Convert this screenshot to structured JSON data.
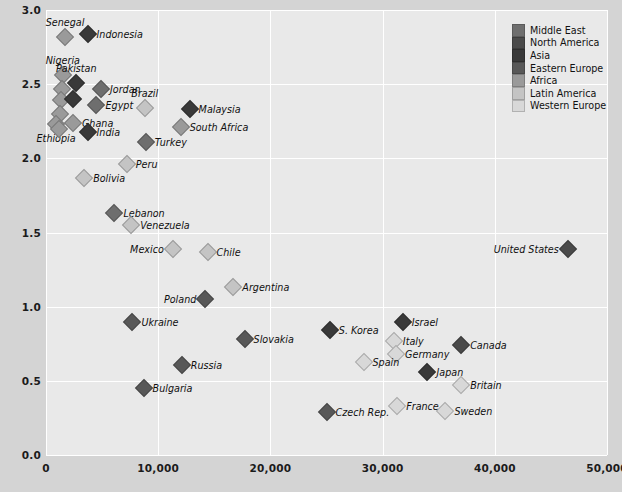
{
  "chart_data": {
    "type": "scatter",
    "title": "",
    "xlabel": "",
    "ylabel": "Score on religiosity scale",
    "xlim": [
      0,
      50000
    ],
    "ylim": [
      0,
      3.0
    ],
    "grid": true,
    "legend_position": "top-right",
    "xticks": [
      "0",
      "10,000",
      "20,000",
      "30,000",
      "40,000",
      "50,000"
    ],
    "xtick_values": [
      0,
      10000,
      20000,
      30000,
      40000,
      50000
    ],
    "yticks": [
      "0.0",
      "0.5",
      "1.0",
      "1.5",
      "2.0",
      "2.5",
      "3.0"
    ],
    "ytick_values": [
      0.0,
      0.5,
      1.0,
      1.5,
      2.0,
      2.5,
      3.0
    ],
    "legend": [
      {
        "name": "Middle East",
        "color": "#6e6e6e"
      },
      {
        "name": "North America",
        "color": "#4a4a4a"
      },
      {
        "name": "Asia",
        "color": "#393939"
      },
      {
        "name": "Eastern Europe",
        "color": "#585858"
      },
      {
        "name": "Africa",
        "color": "#9a9a9a"
      },
      {
        "name": "Latin America",
        "color": "#c4c4c4"
      },
      {
        "name": "Western Europe",
        "color": "#d8d8d8"
      }
    ],
    "points": [
      {
        "name": "Senegal",
        "x": 1700,
        "y": 2.82,
        "group": "Africa",
        "label_pos": "t"
      },
      {
        "name": "Indonesia",
        "x": 3700,
        "y": 2.84,
        "group": "Asia",
        "label_pos": "r"
      },
      {
        "name": "Nigeria",
        "x": 1500,
        "y": 2.56,
        "group": "Africa",
        "label_pos": "t"
      },
      {
        "name": "Pakistan",
        "x": 2700,
        "y": 2.51,
        "group": "Asia",
        "label_pos": "t"
      },
      {
        "name": "Jordan",
        "x": 4900,
        "y": 2.47,
        "group": "Middle East",
        "label_pos": "r"
      },
      {
        "name": "Uganda",
        "x": 1450,
        "y": 2.47,
        "group": "Africa",
        "label_pos": "none"
      },
      {
        "name": "Mali",
        "x": 1350,
        "y": 2.39,
        "group": "Africa",
        "label_pos": "none"
      },
      {
        "name": "Bangladesh",
        "x": 2400,
        "y": 2.4,
        "group": "Asia",
        "label_pos": "none"
      },
      {
        "name": "Egypt",
        "x": 4500,
        "y": 2.36,
        "group": "Middle East",
        "label_pos": "r"
      },
      {
        "name": "Brazil",
        "x": 8800,
        "y": 2.34,
        "group": "Latin America",
        "label_pos": "t"
      },
      {
        "name": "Malaysia",
        "x": 12800,
        "y": 2.33,
        "group": "Asia",
        "label_pos": "r"
      },
      {
        "name": "Tanzania",
        "x": 1250,
        "y": 2.3,
        "group": "Africa",
        "label_pos": "none"
      },
      {
        "name": "Ghana",
        "x": 2400,
        "y": 2.24,
        "group": "Africa",
        "label_pos": "r"
      },
      {
        "name": "South Africa",
        "x": 12000,
        "y": 2.21,
        "group": "Africa",
        "label_pos": "r"
      },
      {
        "name": "Ethiopia",
        "x": 900,
        "y": 2.23,
        "group": "Africa",
        "label_pos": "b"
      },
      {
        "name": "Kenya",
        "x": 1150,
        "y": 2.2,
        "group": "Africa",
        "label_pos": "none"
      },
      {
        "name": "India",
        "x": 3700,
        "y": 2.18,
        "group": "Asia",
        "label_pos": "r"
      },
      {
        "name": "Turkey",
        "x": 8900,
        "y": 2.11,
        "group": "Middle East",
        "label_pos": "r"
      },
      {
        "name": "Peru",
        "x": 7200,
        "y": 1.96,
        "group": "Latin America",
        "label_pos": "r"
      },
      {
        "name": "Bolivia",
        "x": 3400,
        "y": 1.87,
        "group": "Latin America",
        "label_pos": "r"
      },
      {
        "name": "Lebanon",
        "x": 6100,
        "y": 1.63,
        "group": "Middle East",
        "label_pos": "r"
      },
      {
        "name": "Venezuela",
        "x": 7600,
        "y": 1.55,
        "group": "Latin America",
        "label_pos": "r"
      },
      {
        "name": "Mexico",
        "x": 11300,
        "y": 1.39,
        "group": "Latin America",
        "label_pos": "l"
      },
      {
        "name": "Chile",
        "x": 14400,
        "y": 1.37,
        "group": "Latin America",
        "label_pos": "r"
      },
      {
        "name": "United States",
        "x": 46500,
        "y": 1.39,
        "group": "North America",
        "label_pos": "l"
      },
      {
        "name": "Argentina",
        "x": 16700,
        "y": 1.13,
        "group": "Latin America",
        "label_pos": "r"
      },
      {
        "name": "Poland",
        "x": 14200,
        "y": 1.05,
        "group": "Eastern Europe",
        "label_pos": "l"
      },
      {
        "name": "Israel",
        "x": 31800,
        "y": 0.9,
        "group": "Asia",
        "label_pos": "r"
      },
      {
        "name": "Ukraine",
        "x": 7700,
        "y": 0.9,
        "group": "Eastern Europe",
        "label_pos": "r"
      },
      {
        "name": "S. Korea",
        "x": 25300,
        "y": 0.84,
        "group": "Asia",
        "label_pos": "r"
      },
      {
        "name": "Slovakia",
        "x": 17700,
        "y": 0.78,
        "group": "Eastern Europe",
        "label_pos": "r"
      },
      {
        "name": "Italy",
        "x": 31000,
        "y": 0.77,
        "group": "Western Europe",
        "label_pos": "r"
      },
      {
        "name": "Canada",
        "x": 37000,
        "y": 0.74,
        "group": "North America",
        "label_pos": "r"
      },
      {
        "name": "Germany",
        "x": 31200,
        "y": 0.68,
        "group": "Western Europe",
        "label_pos": "r"
      },
      {
        "name": "Spain",
        "x": 28300,
        "y": 0.63,
        "group": "Western Europe",
        "label_pos": "r"
      },
      {
        "name": "Russia",
        "x": 12100,
        "y": 0.61,
        "group": "Eastern Europe",
        "label_pos": "r"
      },
      {
        "name": "Japan",
        "x": 34000,
        "y": 0.56,
        "group": "Asia",
        "label_pos": "r"
      },
      {
        "name": "Britain",
        "x": 37000,
        "y": 0.47,
        "group": "Western Europe",
        "label_pos": "r"
      },
      {
        "name": "Bulgaria",
        "x": 8700,
        "y": 0.45,
        "group": "Eastern Europe",
        "label_pos": "r"
      },
      {
        "name": "Sweden",
        "x": 35600,
        "y": 0.3,
        "group": "Western Europe",
        "label_pos": "r"
      },
      {
        "name": "France",
        "x": 31300,
        "y": 0.33,
        "group": "Western Europe",
        "label_pos": "r"
      },
      {
        "name": "Czech Rep.",
        "x": 25000,
        "y": 0.29,
        "group": "Eastern Europe",
        "label_pos": "r"
      }
    ]
  }
}
